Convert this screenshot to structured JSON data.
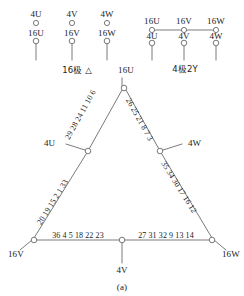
{
  "figure": {
    "caption": "(a)",
    "top_left_group": {
      "footer_label": "16极 △",
      "row_top": [
        "4U",
        "4V",
        "4W"
      ],
      "row_bottom": [
        "16U",
        "16V",
        "16W"
      ],
      "linked_row": "none"
    },
    "top_right_group": {
      "footer_label": "4极2Y",
      "row_top": [
        "16U",
        "16V",
        "16W"
      ],
      "row_bottom": [
        "4U",
        "4V",
        "4W"
      ],
      "linked_row": "top"
    },
    "triangle": {
      "apex_label": "16U",
      "bottom_left_label": "16V",
      "bottom_right_label": "16W",
      "bottom_center_label": "4V",
      "mid_left_label": "4U",
      "mid_right_label": "4W",
      "left_leg_upper_coils": "29 28 24 11 10 6",
      "right_leg_upper_coils": "26 25 21 8 7 3",
      "left_leg_lower_coils": "20 19 15 2 1 33",
      "right_leg_lower_coils": "35 34 30 17 16 12",
      "bottom_left_coils": "36 4 5 18 22 23",
      "bottom_right_coils": "27 31 32 9 13 14"
    },
    "colors": {
      "line": "#6b6b6b",
      "text": "#1b1b1b",
      "background": "#ffffff"
    }
  }
}
